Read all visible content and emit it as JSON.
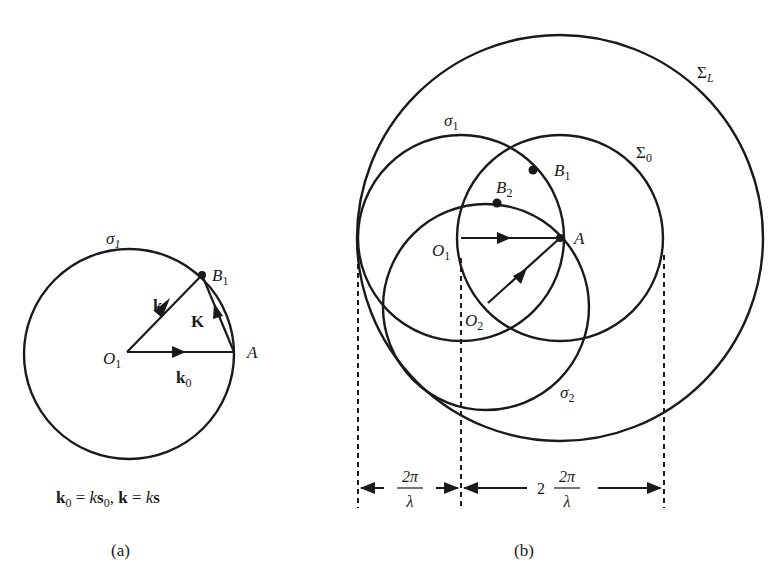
{
  "figure_a": {
    "caption": "(a)",
    "circle_label": "σ",
    "circle_label_sub": "1",
    "point_B": "B",
    "point_B_sub": "1",
    "point_A": "A",
    "origin": "O",
    "origin_sub": "1",
    "vec_k": "k",
    "vec_K": "K",
    "vec_k0": "k",
    "vec_k0_sub": "0",
    "equation": {
      "p1": "k",
      "p1_sub": "0",
      "p2": " = ",
      "p3": "k",
      "p4": "s",
      "p4_sub": "0",
      "p5": ", ",
      "p6": "k",
      "p7": " = ",
      "p8": "k",
      "p9": "s"
    }
  },
  "figure_b": {
    "caption": "(b)",
    "sigma_L": "Σ",
    "sigma_L_sub": "L",
    "sigma_1": "σ",
    "sigma_1_sub": "1",
    "sigma_0": "Σ",
    "sigma_0_sub": "0",
    "sigma_2": "σ",
    "sigma_2_sub": "2",
    "point_B1": "B",
    "point_B1_sub": "1",
    "point_B2": "B",
    "point_B2_sub": "2",
    "point_A": "A",
    "origin_1": "O",
    "origin_1_sub": "1",
    "origin_2": "O",
    "origin_2_sub": "2",
    "dim_left_num": "2π",
    "dim_left_den": "λ",
    "dim_right_coef": "2",
    "dim_right_num": "2π",
    "dim_right_den": "λ"
  }
}
